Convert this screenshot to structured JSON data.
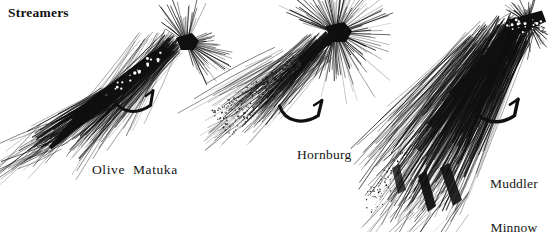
{
  "page": {
    "width": 554,
    "height": 232,
    "background_color": "#ffffff",
    "ink_color": "#101010",
    "heading": "Streamers",
    "medium": "pen-and-ink line illustration"
  },
  "flies": [
    {
      "id": "olive-matuka",
      "caption": "Olive  Matuka",
      "caption_lines": [
        "Olive  Matuka"
      ],
      "head_xy": [
        186,
        44
      ],
      "tail_xy": [
        34,
        152
      ],
      "axis_angle_deg": 214,
      "hook_bend_xy": [
        133,
        104
      ],
      "hook_point_xy": [
        160,
        90
      ],
      "wing_style": "matuka-strip",
      "hackle_style": "radiating-collar"
    },
    {
      "id": "hornburg",
      "caption": "Hornburg",
      "caption_lines": [
        "Hornburg"
      ],
      "head_xy": [
        336,
        38
      ],
      "tail_xy": [
        222,
        132
      ],
      "axis_angle_deg": 220,
      "hook_bend_xy": [
        300,
        112
      ],
      "hook_point_xy": [
        322,
        98
      ],
      "wing_style": "mallard-flank-stippled",
      "hackle_style": "dense-radiating-collar"
    },
    {
      "id": "muddler-minnow",
      "caption_lines": [
        "Muddler",
        "Minnow"
      ],
      "caption": "Muddler Minnow",
      "head_xy": [
        528,
        22
      ],
      "tail_xy": [
        392,
        215
      ],
      "axis_angle_deg": 235,
      "hook_bend_xy": [
        493,
        113
      ],
      "hook_point_xy": [
        524,
        100
      ],
      "wing_style": "long-hair-wing",
      "hackle_style": "spun-deer-hair-head"
    }
  ],
  "colors": {
    "ink": "#101010",
    "paper": "#ffffff",
    "text": "#141414"
  }
}
